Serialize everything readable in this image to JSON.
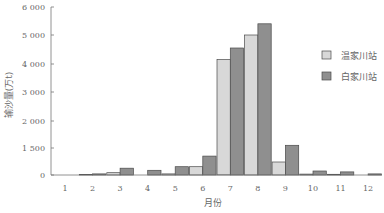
{
  "chart_data": {
    "type": "bar",
    "title": "",
    "xlabel": "月份",
    "ylabel": "输沙量(万t)",
    "categories": [
      "1",
      "2",
      "3",
      "4",
      "5",
      "6",
      "7",
      "8",
      "9",
      "10",
      "11",
      "12"
    ],
    "series": [
      {
        "name": "温家川站",
        "color": "#d8d8d8",
        "values": [
          0,
          20,
          130,
          10,
          60,
          460,
          4150,
          5000,
          720,
          50,
          40,
          10
        ]
      },
      {
        "name": "白家川站",
        "color": "#8f8f8f",
        "values": [
          5,
          60,
          380,
          260,
          460,
          1050,
          4550,
          5400,
          1550,
          220,
          170,
          60
        ]
      }
    ],
    "yticks": [
      {
        "label": "0",
        "value": 0
      },
      {
        "label": "1 500",
        "value": 1500
      },
      {
        "label": "2 000",
        "value": 2000
      },
      {
        "label": "3 000",
        "value": 3000
      },
      {
        "label": "4 000",
        "value": 4000
      },
      {
        "label": "5 000",
        "value": 5000
      },
      {
        "label": "6 000",
        "value": 6000
      }
    ],
    "ylim": [
      0,
      6000
    ],
    "grid": false,
    "legend_position": "right",
    "bar_border_color": "#4a4a4a",
    "axis_color": "#777777"
  }
}
